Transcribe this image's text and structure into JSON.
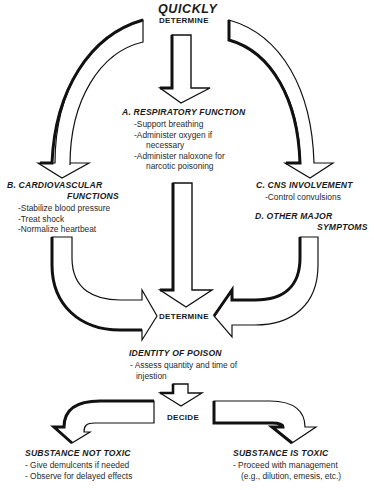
{
  "title": {
    "line1": "QUICKLY",
    "line2": "DETERMINE"
  },
  "sections": {
    "respiratory": {
      "header": "A. RESPIRATORY FUNCTION",
      "items": [
        "-Support breathing",
        "-Administer oxygen if",
        "necessary",
        "-Administer naloxone for",
        "narcotic poisoning"
      ]
    },
    "cardiovascular": {
      "header_line1": "B. CARDIOVASCULAR",
      "header_line2": "FUNCTIONS",
      "items": [
        "-Stabilize blood pressure",
        "-Treat shock",
        "-Normalize heartbeat"
      ]
    },
    "cns": {
      "header": "C. CNS INVOLVEMENT",
      "items": [
        "-Control convulsions"
      ]
    },
    "other": {
      "header_line1": "D. OTHER MAJOR",
      "header_line2": "SYMPTOMS"
    }
  },
  "center": {
    "determine": "DETERMINE",
    "identity_header": "IDENTITY OF POISON",
    "identity_items": [
      "- Assess quantity and time of",
      "injestion"
    ],
    "decide": "DECIDE"
  },
  "outcomes": {
    "not_toxic": {
      "header": "SUBSTANCE NOT TOXIC",
      "items": [
        "- Give demulcents if needed",
        "- Observe for delayed effects"
      ]
    },
    "toxic": {
      "header": "SUBSTANCE IS TOXIC",
      "items": [
        "- Proceed with management",
        "(e.g., dilution, emesis, etc.)"
      ]
    }
  },
  "colors": {
    "stroke": "#111111",
    "fill": "#ffffff",
    "text": "#1a1a1a"
  }
}
